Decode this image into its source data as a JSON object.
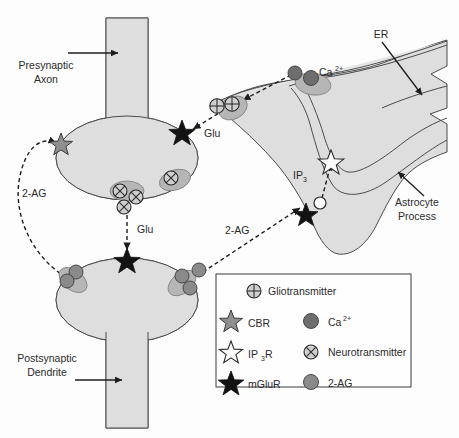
{
  "figure": {
    "background_color": "#fdfdfd"
  },
  "labels": {
    "presynaptic_axon": "Presynaptic\nAxon",
    "presynaptic_axon_line1": "Presynaptic",
    "presynaptic_axon_line2": "Axon",
    "postsynaptic_dendrite_line1": "Postsynaptic",
    "postsynaptic_dendrite_line2": "Dendrite",
    "astrocyte_process_line1": "Astrocyte",
    "astrocyte_process_line2": "Process",
    "er": "ER",
    "calcium": "Ca",
    "calcium_sup": "2+",
    "ip3": "IP",
    "ip3_sub": "3",
    "glu_upper": "Glu",
    "glu_lower": "Glu",
    "two_ag_left": "2-AG",
    "two_ag_right": "2-AG"
  },
  "legend": {
    "items": [
      {
        "symbol": "gliotransmitter-icon",
        "label": "Gliotransmitter",
        "column": 1,
        "row": 0
      },
      {
        "symbol": "cbr-star-icon",
        "label": "CBR",
        "column": 1,
        "row": 1
      },
      {
        "symbol": "ip3r-star-icon",
        "label": "IP3R",
        "label_main": "IP",
        "label_sub": "3",
        "label_tail": "R",
        "column": 1,
        "row": 2
      },
      {
        "symbol": "mglur-star-icon",
        "label": "mGluR",
        "column": 1,
        "row": 3
      },
      {
        "symbol": "calcium-dot-icon",
        "label": "Ca2+",
        "label_main": "Ca",
        "label_sup": "2+",
        "column": 2,
        "row": 1
      },
      {
        "symbol": "neurotransmitter-icon",
        "label": "Neurotransmitter",
        "column": 2,
        "row": 2
      },
      {
        "symbol": "two-ag-dot-icon",
        "label": "2-AG",
        "column": 2,
        "row": 3
      }
    ]
  },
  "colors": {
    "cell_fill": "#dedede",
    "er_fill": "#e4e4e4",
    "outline": "#4a4a4a",
    "star_gray": "#8f8f8f",
    "star_black": "#121212",
    "dot_dark": "#6e6e6e",
    "dot_mid": "#8a8a8a",
    "blob": "#b6b6b6",
    "text": "#2b2b2b"
  },
  "pathways": [
    {
      "name": "glu-to-astrocyte",
      "from": "presynaptic terminal mGluR",
      "to": "astrocyte gliotransmitter",
      "label": "Glu",
      "style": "dashed"
    },
    {
      "name": "glu-to-postsynaptic",
      "from": "presynaptic vesicle",
      "to": "postsynaptic mGluR",
      "label": "Glu",
      "style": "dashed"
    },
    {
      "name": "2-AG-to-astrocyte",
      "from": "postsynaptic 2-AG",
      "to": "astrocyte mGluR",
      "label": "2-AG",
      "style": "dashed"
    },
    {
      "name": "2-AG-to-presynaptic-CBR",
      "from": "postsynaptic 2-AG",
      "to": "presynaptic CBR",
      "label": "2-AG",
      "style": "dashed"
    },
    {
      "name": "ip3-to-ip3r",
      "from": "IP3",
      "to": "IP3R on ER",
      "label": "IP3",
      "style": "dashed"
    },
    {
      "name": "calcium-to-gliotransmitter",
      "from": "Ca2+ store",
      "to": "gliotransmitter release",
      "label": "",
      "style": "dashed"
    }
  ]
}
